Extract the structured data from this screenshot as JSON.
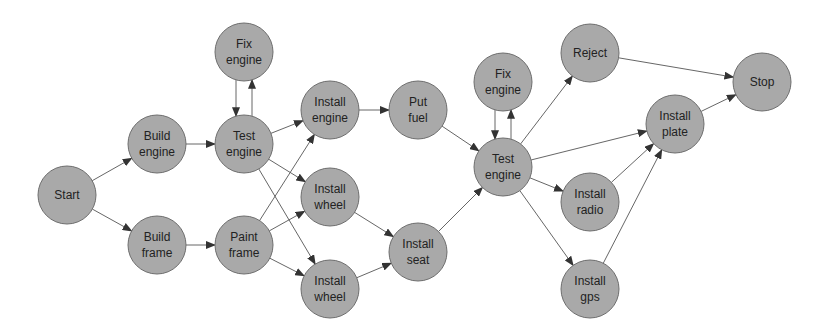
{
  "diagram": {
    "type": "directed-graph",
    "colors": {
      "node_fill": "#a9a9a9",
      "node_stroke": "#6e6e6e",
      "edge": "#555555",
      "background": "#ffffff"
    },
    "nodes": [
      {
        "id": "start",
        "lines": [
          "Start"
        ],
        "x": 67,
        "y": 195
      },
      {
        "id": "build_engine",
        "lines": [
          "Build",
          "engine"
        ],
        "x": 157,
        "y": 144
      },
      {
        "id": "build_frame",
        "lines": [
          "Build",
          "frame"
        ],
        "x": 157,
        "y": 245
      },
      {
        "id": "fix_engine_1",
        "lines": [
          "Fix",
          "engine"
        ],
        "x": 244,
        "y": 52
      },
      {
        "id": "test_engine_1",
        "lines": [
          "Test",
          "engine"
        ],
        "x": 244,
        "y": 144
      },
      {
        "id": "paint_frame",
        "lines": [
          "Paint",
          "frame"
        ],
        "x": 244,
        "y": 245
      },
      {
        "id": "install_engine",
        "lines": [
          "Install",
          "engine"
        ],
        "x": 330,
        "y": 110
      },
      {
        "id": "install_wheel_1",
        "lines": [
          "Install",
          "wheel"
        ],
        "x": 330,
        "y": 197
      },
      {
        "id": "install_wheel_2",
        "lines": [
          "Install",
          "wheel"
        ],
        "x": 330,
        "y": 289
      },
      {
        "id": "put_fuel",
        "lines": [
          "Put",
          "fuel"
        ],
        "x": 418,
        "y": 110
      },
      {
        "id": "install_seat",
        "lines": [
          "Install",
          "seat"
        ],
        "x": 418,
        "y": 252
      },
      {
        "id": "fix_engine_2",
        "lines": [
          "Fix",
          "engine"
        ],
        "x": 503,
        "y": 82
      },
      {
        "id": "test_engine_2",
        "lines": [
          "Test",
          "engine"
        ],
        "x": 503,
        "y": 167
      },
      {
        "id": "reject",
        "lines": [
          "Reject"
        ],
        "x": 590,
        "y": 53
      },
      {
        "id": "install_radio",
        "lines": [
          "Install",
          "radio"
        ],
        "x": 590,
        "y": 202
      },
      {
        "id": "install_gps",
        "lines": [
          "Install",
          "gps"
        ],
        "x": 590,
        "y": 289
      },
      {
        "id": "install_plate",
        "lines": [
          "Install",
          "plate"
        ],
        "x": 675,
        "y": 124
      },
      {
        "id": "stop",
        "lines": [
          "Stop"
        ],
        "x": 762,
        "y": 82
      }
    ],
    "edges": [
      {
        "from": "start",
        "to": "build_engine"
      },
      {
        "from": "start",
        "to": "build_frame"
      },
      {
        "from": "build_engine",
        "to": "test_engine_1"
      },
      {
        "from": "build_frame",
        "to": "paint_frame"
      },
      {
        "from": "fix_engine_1",
        "to": "test_engine_1",
        "dx": -8
      },
      {
        "from": "test_engine_1",
        "to": "fix_engine_1",
        "dx": 8
      },
      {
        "from": "test_engine_1",
        "to": "install_engine"
      },
      {
        "from": "test_engine_1",
        "to": "install_wheel_1"
      },
      {
        "from": "test_engine_1",
        "to": "install_wheel_2"
      },
      {
        "from": "paint_frame",
        "to": "install_engine"
      },
      {
        "from": "paint_frame",
        "to": "install_wheel_1"
      },
      {
        "from": "paint_frame",
        "to": "install_wheel_2"
      },
      {
        "from": "install_engine",
        "to": "put_fuel"
      },
      {
        "from": "install_wheel_1",
        "to": "install_seat"
      },
      {
        "from": "install_wheel_2",
        "to": "install_seat"
      },
      {
        "from": "put_fuel",
        "to": "test_engine_2"
      },
      {
        "from": "install_seat",
        "to": "test_engine_2"
      },
      {
        "from": "fix_engine_2",
        "to": "test_engine_2",
        "dx": -8
      },
      {
        "from": "test_engine_2",
        "to": "fix_engine_2",
        "dx": 8
      },
      {
        "from": "test_engine_2",
        "to": "reject"
      },
      {
        "from": "test_engine_2",
        "to": "install_plate"
      },
      {
        "from": "test_engine_2",
        "to": "install_radio"
      },
      {
        "from": "test_engine_2",
        "to": "install_gps"
      },
      {
        "from": "install_radio",
        "to": "install_plate"
      },
      {
        "from": "install_gps",
        "to": "install_plate"
      },
      {
        "from": "reject",
        "to": "stop"
      },
      {
        "from": "install_plate",
        "to": "stop"
      }
    ]
  }
}
